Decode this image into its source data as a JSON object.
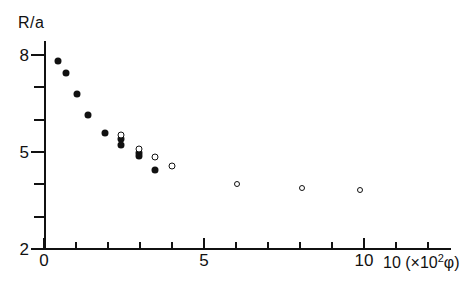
{
  "figure": {
    "y_axis_title": "R/a",
    "x_axis_title_number": "10",
    "x_axis_title_unit_prefix": "(×10",
    "x_axis_title_unit_exp": "2",
    "x_axis_title_unit_suffix": "φ)"
  },
  "chart_data": {
    "type": "scatter",
    "title": "",
    "xlabel": "(×10² φ)",
    "ylabel": "R/a",
    "xlim": [
      0,
      12.7
    ],
    "ylim": [
      2,
      8.4
    ],
    "xticks": [
      0,
      1,
      2,
      3,
      4,
      5,
      6,
      7,
      8,
      9,
      10,
      11,
      12
    ],
    "xticklabels": [
      "0",
      "",
      "",
      "",
      "",
      "5",
      "",
      "",
      "",
      "",
      "10",
      "",
      ""
    ],
    "yticks": [
      2,
      3,
      4,
      5,
      6,
      7,
      8
    ],
    "yticklabels": [
      "2",
      "",
      "",
      "5",
      "",
      "",
      "8"
    ],
    "grid": false,
    "legend": "none",
    "series": [
      {
        "name": "filled-circles",
        "marker": "filled circle",
        "color": "#111111",
        "points": [
          {
            "x": 0.44,
            "y": 7.83
          },
          {
            "x": 0.69,
            "y": 7.43
          },
          {
            "x": 1.03,
            "y": 6.78
          },
          {
            "x": 1.38,
            "y": 6.13
          },
          {
            "x": 1.91,
            "y": 5.58
          },
          {
            "x": 2.41,
            "y": 5.39
          },
          {
            "x": 2.41,
            "y": 5.22
          },
          {
            "x": 2.97,
            "y": 4.97
          },
          {
            "x": 2.97,
            "y": 4.88
          },
          {
            "x": 3.47,
            "y": 4.45
          }
        ]
      },
      {
        "name": "open-circles",
        "marker": "open circle",
        "color": "#111111",
        "points": [
          {
            "x": 2.41,
            "y": 5.53
          },
          {
            "x": 2.97,
            "y": 5.1
          },
          {
            "x": 3.47,
            "y": 4.85
          },
          {
            "x": 4.0,
            "y": 4.56
          },
          {
            "x": 6.03,
            "y": 4.0
          },
          {
            "x": 8.06,
            "y": 3.88
          },
          {
            "x": 9.88,
            "y": 3.82
          }
        ]
      }
    ]
  }
}
